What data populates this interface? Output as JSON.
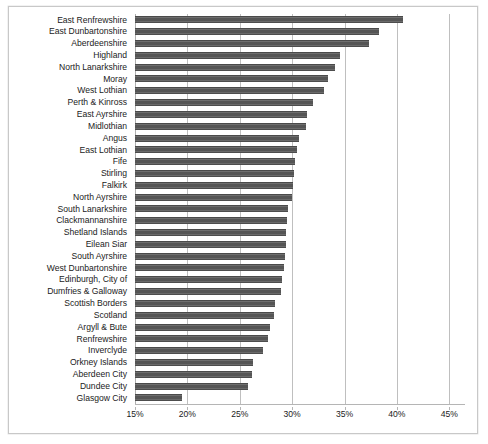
{
  "chart_data": {
    "type": "bar",
    "orientation": "horizontal",
    "title": "",
    "subtitle": "",
    "xlabel": "",
    "ylabel": "",
    "xlim": [
      15,
      46.5
    ],
    "xticks": [
      15,
      20,
      25,
      30,
      35,
      40,
      45
    ],
    "xtick_labels": [
      "15%",
      "20%",
      "25%",
      "30%",
      "35%",
      "40%",
      "45%"
    ],
    "grid": true,
    "legend": false,
    "bar_color": "#595959",
    "categories": [
      "East Renfrewshire",
      "East Dunbartonshire",
      "Aberdeenshire",
      "Highland",
      "North Lanarkshire",
      "Moray",
      "West Lothian",
      "Perth & Kinross",
      "East Ayrshire",
      "Midlothian",
      "Angus",
      "East Lothian",
      "Fife",
      "Stirling",
      "Falkirk",
      "North Ayrshire",
      "South Lanarkshire",
      "Clackmannanshire",
      "Shetland Islands",
      "Eilean Siar",
      "South Ayrshire",
      "West Dunbartonshire",
      "Edinburgh, City of",
      "Dumfries & Galloway",
      "Scottish Borders",
      "Scotland",
      "Argyll & Bute",
      "Renfrewshire",
      "Inverclyde",
      "Orkney Islands",
      "Aberdeen City",
      "Dundee City",
      "Glasgow City"
    ],
    "values": [
      40.6,
      38.3,
      37.3,
      34.6,
      34.1,
      33.4,
      33.0,
      32.0,
      31.4,
      31.3,
      30.7,
      30.5,
      30.3,
      30.2,
      30.1,
      30.0,
      29.6,
      29.5,
      29.4,
      29.4,
      29.3,
      29.2,
      29.0,
      28.9,
      28.4,
      28.3,
      27.9,
      27.7,
      27.2,
      26.3,
      26.2,
      25.8,
      19.5
    ]
  }
}
